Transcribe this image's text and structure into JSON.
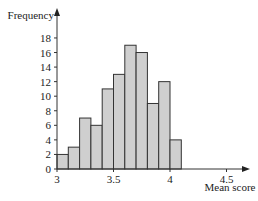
{
  "chart_data": {
    "type": "bar",
    "subtype": "histogram",
    "title": "",
    "xlabel": "Mean score",
    "ylabel": "Frequency",
    "bins": [
      {
        "start": 3.0,
        "end": 3.1,
        "value": 2
      },
      {
        "start": 3.1,
        "end": 3.2,
        "value": 3
      },
      {
        "start": 3.2,
        "end": 3.3,
        "value": 7
      },
      {
        "start": 3.3,
        "end": 3.4,
        "value": 6
      },
      {
        "start": 3.4,
        "end": 3.5,
        "value": 11
      },
      {
        "start": 3.5,
        "end": 3.6,
        "value": 13
      },
      {
        "start": 3.6,
        "end": 3.7,
        "value": 17
      },
      {
        "start": 3.7,
        "end": 3.8,
        "value": 16
      },
      {
        "start": 3.8,
        "end": 3.9,
        "value": 9
      },
      {
        "start": 3.9,
        "end": 4.0,
        "value": 12
      },
      {
        "start": 4.0,
        "end": 4.1,
        "value": 4
      }
    ],
    "categories": [
      "3.0-3.1",
      "3.1-3.2",
      "3.2-3.3",
      "3.3-3.4",
      "3.4-3.5",
      "3.5-3.6",
      "3.6-3.7",
      "3.7-3.8",
      "3.8-3.9",
      "3.9-4.0",
      "4.0-4.1"
    ],
    "values": [
      2,
      3,
      7,
      6,
      11,
      13,
      17,
      16,
      9,
      12,
      4
    ],
    "xticks": [
      3,
      3.5,
      4,
      4.5
    ],
    "xtick_labels": [
      "3",
      "3.5",
      "4",
      "4.5"
    ],
    "yticks": [
      0,
      2,
      4,
      6,
      8,
      10,
      12,
      14,
      16,
      18
    ],
    "xlim": [
      3,
      4.65
    ],
    "ylim": [
      0,
      19.5
    ],
    "grid": false,
    "legend": null,
    "colors": {
      "bar_fill": "#cfcfcf",
      "bar_edge": "#333333",
      "axis": "#333333"
    }
  }
}
